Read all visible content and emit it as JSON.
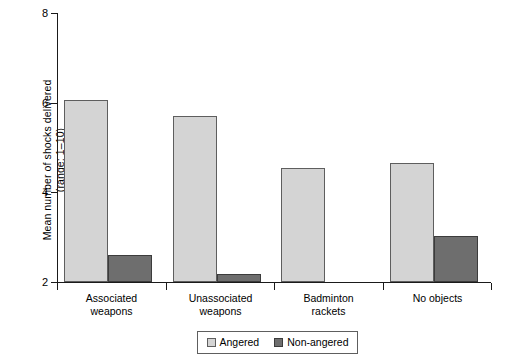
{
  "chart_data": {
    "type": "bar",
    "title": "",
    "xlabel": "",
    "ylabel": "Mean number of shocks delivered (range: 1–10)",
    "ylabel_line1": "Mean number of shocks delivered",
    "ylabel_line2": "(range: 1–10)",
    "ylim": [
      2,
      8
    ],
    "yticks": [
      2,
      4,
      6,
      8
    ],
    "ytick_labels": [
      "2",
      "4",
      "6",
      "8"
    ],
    "grid": false,
    "legend_position": "bottom-center",
    "categories": [
      "Associated weapons",
      "Unassociated weapons",
      "Badminton rackets",
      "No objects"
    ],
    "category_lines": [
      [
        "Associated",
        "weapons"
      ],
      [
        "Unassociated",
        "weapons"
      ],
      [
        "Badminton",
        "rackets"
      ],
      [
        "No objects"
      ]
    ],
    "series": [
      {
        "name": "Angered",
        "color": "#d4d4d4",
        "values": [
          6.05,
          5.7,
          4.55,
          4.66
        ]
      },
      {
        "name": "Non-angered",
        "color": "#6e6e6e",
        "values": [
          2.6,
          2.18,
          2.0,
          3.03
        ]
      }
    ]
  },
  "legend": {
    "items": [
      {
        "label": "Angered",
        "swatch": "angered"
      },
      {
        "label": "Non-angered",
        "swatch": "nonangered"
      }
    ]
  },
  "colors": {
    "angered": "#d4d4d4",
    "nonangered": "#6e6e6e",
    "axis": "#1a1a1a",
    "bar_outline": "#5e5e5e",
    "background": "#ffffff"
  }
}
